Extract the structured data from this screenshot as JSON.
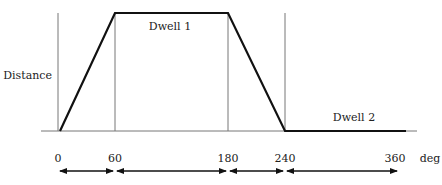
{
  "diagram": {
    "y_axis_label": "Distance",
    "x_unit_label": "deg",
    "segments": [
      {
        "name": "rise",
        "from_deg": 0,
        "to_deg": 60
      },
      {
        "name": "Dwell 1",
        "from_deg": 60,
        "to_deg": 180
      },
      {
        "name": "return",
        "from_deg": 180,
        "to_deg": 240
      },
      {
        "name": "Dwell 2",
        "from_deg": 240,
        "to_deg": 360
      }
    ],
    "labels": {
      "dwell1": "Dwell 1",
      "dwell2": "Dwell 2"
    },
    "ticks": [
      "0",
      "60",
      "180",
      "240",
      "360"
    ],
    "colors": {
      "profile": "#111111",
      "guide": "#777777",
      "text": "#222222"
    }
  }
}
